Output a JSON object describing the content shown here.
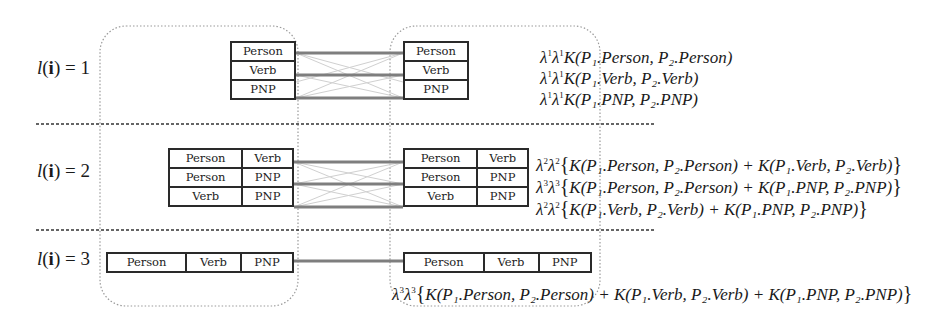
{
  "levels": [
    {
      "label": {
        "prefix": "l",
        "arg": "i",
        "value": "1"
      },
      "left_rows": [
        [
          "Person"
        ],
        [
          "Verb"
        ],
        [
          "PNP"
        ]
      ],
      "right_rows": [
        [
          "Person"
        ],
        [
          "Verb"
        ],
        [
          "PNP"
        ]
      ],
      "formulas": [
        {
          "lambda": "1",
          "body": "K(P₁.Person, P₂.Person)"
        },
        {
          "lambda": "1",
          "body": "K(P₁.Verb, P₂.Verb)"
        },
        {
          "lambda": "1",
          "body": "K(P₁.PNP, P₂.PNP)"
        }
      ]
    },
    {
      "label": {
        "prefix": "l",
        "arg": "i",
        "value": "2"
      },
      "left_rows": [
        [
          "Person",
          "Verb"
        ],
        [
          "Person",
          "PNP"
        ],
        [
          "Verb",
          "PNP"
        ]
      ],
      "right_rows": [
        [
          "Person",
          "Verb"
        ],
        [
          "Person",
          "PNP"
        ],
        [
          "Verb",
          "PNP"
        ]
      ],
      "formulas": [
        {
          "lambda": "2",
          "body": "K(P₁.Person, P₂.Person) + K(P₁.Verb, P₂.Verb)"
        },
        {
          "lambda": "3",
          "body": "K(P₁.Person, P₂.Person) + K(P₁.PNP, P₂.PNP)"
        },
        {
          "lambda": "2",
          "body": "K(P₁.Verb, P₂.Verb) + K(P₁.PNP, P₂.PNP)"
        }
      ]
    },
    {
      "label": {
        "prefix": "l",
        "arg": "i",
        "value": "3"
      },
      "left_rows": [
        [
          "Person",
          "Verb",
          "PNP"
        ]
      ],
      "right_rows": [
        [
          "Person",
          "Verb",
          "PNP"
        ]
      ],
      "formulas": [
        {
          "lambda": "3",
          "body": "K(P₁.Person, P₂.Person) + K(P₁.Verb, P₂.Verb) + K(P₁.PNP, P₂.PNP)"
        }
      ]
    }
  ],
  "symbols": {
    "lambda": "λ",
    "equals": "=",
    "lparen": "(",
    "rparen": ")",
    "lbrace": "{",
    "rbrace": "}"
  },
  "colors": {
    "box_border": "#2a2a2a",
    "connector": "#8a8a8a",
    "cross": "#cfcfcf",
    "dotted": "#9a9a9a",
    "separator": "#333333"
  }
}
